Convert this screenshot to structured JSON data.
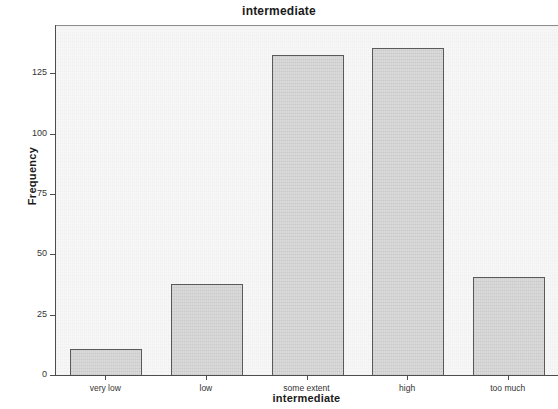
{
  "chart_data": {
    "type": "bar",
    "title": "intermediate",
    "xlabel": "intermediate",
    "ylabel": "Frequency",
    "categories": [
      "very low",
      "low",
      "some extent",
      "high",
      "too much"
    ],
    "values": [
      11,
      38,
      133,
      136,
      41
    ],
    "ylim": [
      0,
      145
    ],
    "yticks": [
      0,
      25,
      50,
      75,
      100,
      125
    ],
    "ytick_labels": [
      "0",
      "25",
      "50",
      "75",
      "100",
      "125"
    ],
    "grid": false,
    "legend": null,
    "bar_fill_color": "#d9d9d9",
    "bar_border_color": "#5a5a5a",
    "plot_background_color": "#f7f7f7",
    "axis_color": "#4d4d4d"
  }
}
